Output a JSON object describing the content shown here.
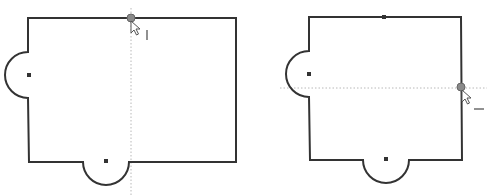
{
  "diagram": {
    "type": "sketch-constraint-illustration",
    "panels": [
      {
        "id": "left",
        "description": "Rectangle sketch with semicircular bumps on left and bottom; pointer snapping to top edge with vertical inference line",
        "rect": {
          "x1": 28,
          "y1": 18,
          "x2": 236,
          "y2": 162
        },
        "arcs": [
          {
            "side": "left",
            "cx": 28,
            "cy": 75,
            "r": 23
          },
          {
            "side": "bottom",
            "cx": 106,
            "cy": 162,
            "r": 23
          }
        ],
        "center_markers": [
          [
            29,
            75
          ],
          [
            106,
            161
          ]
        ],
        "snap_point": [
          131,
          18
        ],
        "inference_line": {
          "orientation": "vertical",
          "x": 131
        },
        "constraint_glyph": "vertical"
      },
      {
        "id": "right",
        "description": "Rectangle sketch with semicircular bumps on left and bottom; pointer snapping to right edge with horizontal inference line",
        "rect": {
          "x1": 309,
          "y1": 17,
          "x2": 461,
          "y2": 160
        },
        "arcs": [
          {
            "side": "left",
            "cx": 309,
            "cy": 74,
            "r": 23
          },
          {
            "side": "bottom",
            "cx": 386,
            "cy": 160,
            "r": 23
          }
        ],
        "center_markers": [
          [
            309,
            74
          ],
          [
            386,
            159
          ],
          [
            384,
            17
          ]
        ],
        "snap_point": [
          461,
          87
        ],
        "inference_line": {
          "orientation": "horizontal",
          "y": 88
        },
        "constraint_glyph": "horizontal"
      }
    ],
    "colors": {
      "outline": "#333333",
      "guide": "#b8b8b8",
      "snap_dot": "#8a8a8a",
      "background": "#ffffff"
    },
    "icons": {
      "cursor": "arrow-pointer-icon",
      "vertical_constraint": "vertical-relation-icon",
      "horizontal_constraint": "horizontal-relation-icon"
    }
  }
}
